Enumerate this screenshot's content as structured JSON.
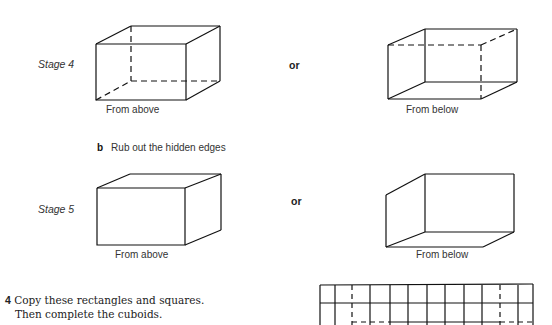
{
  "stage4": {
    "label": "Stage 4",
    "or": "or",
    "above_caption": "From above",
    "below_caption": "From below"
  },
  "part_b": {
    "letter": "b",
    "text": "Rub out the hidden edges"
  },
  "stage5": {
    "label": "Stage 5",
    "or": "or",
    "above_caption": "From above",
    "below_caption": "From below"
  },
  "question4": {
    "number": "4",
    "line1": "Copy these rectangles and squares.",
    "line2": "Then complete the cuboids."
  }
}
